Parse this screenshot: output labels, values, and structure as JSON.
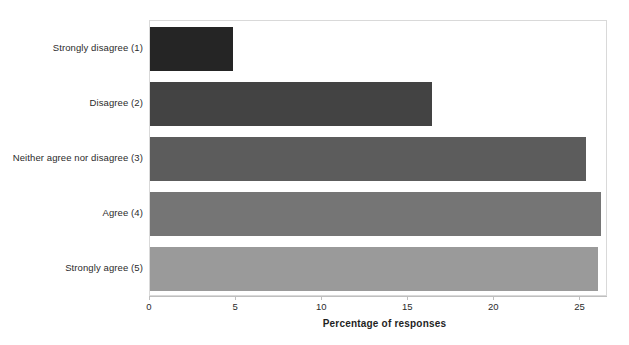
{
  "chart_data": {
    "type": "bar",
    "orientation": "horizontal",
    "title": "",
    "xlabel": "Percentage of responses",
    "ylabel": "",
    "categories": [
      "Strongly disagree (1)",
      "Disagree (2)",
      "Neither agree nor disagree (3)",
      "Agree (4)",
      "Strongly agree (5)"
    ],
    "values": [
      4.8,
      16.4,
      25.3,
      26.2,
      26.0
    ],
    "xlim": [
      0,
      26.6
    ],
    "xticks": [
      0,
      5,
      10,
      15,
      20,
      25
    ],
    "xtick_labels": [
      "0",
      "5",
      "10",
      "15",
      "20",
      "25"
    ],
    "grid": false,
    "legend": "none",
    "bar_colors": [
      "#252525",
      "#434343",
      "#5c5c5c",
      "#757575",
      "#9a9a9a"
    ],
    "frame_color": "#d9d9d9",
    "axis_color": "#bfbfbf",
    "text_color": "#2b2b2b"
  }
}
